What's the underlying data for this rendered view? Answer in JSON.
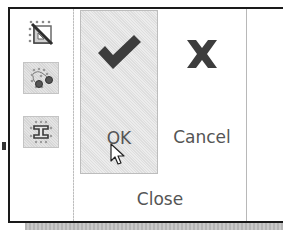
{
  "ribbon": {
    "left_tools": [
      {
        "name": "constraint-triangle",
        "icon": "right-triangle-grid-icon",
        "framed": false
      },
      {
        "name": "snap-points",
        "icon": "snap-points-icon",
        "framed": true
      },
      {
        "name": "i-beam-section",
        "icon": "i-beam-icon",
        "framed": true
      }
    ],
    "close_group": {
      "label": "Close",
      "buttons": [
        {
          "label": "OK",
          "icon": "checkmark-icon",
          "state": "hovered"
        },
        {
          "label": "Cancel",
          "icon": "x-icon",
          "state": "normal"
        }
      ]
    }
  },
  "colors": {
    "icon_dark": "#3d3d3d",
    "text": "#555555",
    "border": "#1a1a1a",
    "hover_bg": "#e4e4e4"
  },
  "cursor": {
    "type": "arrow-pointer",
    "over": "OK"
  }
}
